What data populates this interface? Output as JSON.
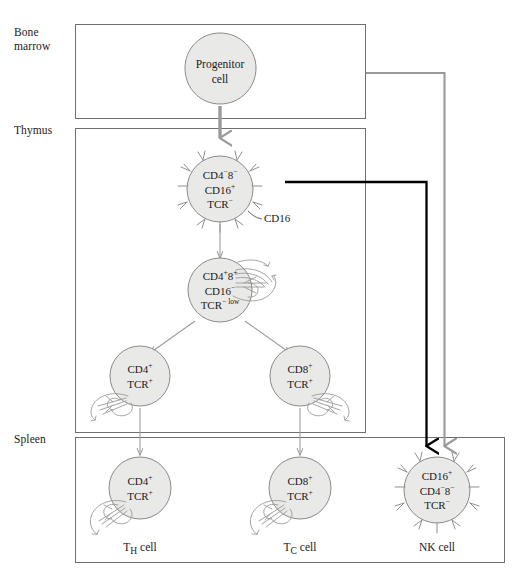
{
  "figure": {
    "background_color": "#ffffff",
    "cell_fill_color": "#e9e9e7",
    "cell_stroke_color": "#8a8a8a",
    "box_stroke_color": "#6f6f6f",
    "gray_arrow_color": "#9a9a9a",
    "black_arrow_color": "#000000"
  },
  "compartments": [
    {
      "id": "bone-marrow",
      "label": "Bone\nmarrow"
    },
    {
      "id": "thymus",
      "label": "Thymus"
    },
    {
      "id": "spleen",
      "label": "Spleen"
    }
  ],
  "cells": {
    "progenitor": {
      "name": "Progenitor cell",
      "label": "Progenitor\ncell"
    },
    "thymus_dn": {
      "name": "double negative thymocyte",
      "markers": [
        {
          "gene": "CD4",
          "sign": "−",
          "gene2": "8",
          "sign2": "−"
        },
        {
          "gene": "CD16",
          "sign": "+"
        },
        {
          "gene": "TCR",
          "sign": "−"
        }
      ],
      "line1": "CD4",
      "line1_sup1": "−",
      "line1_mid": "8",
      "line1_sup2": "−",
      "line2": "CD16",
      "line2_sup": "+",
      "line3": "TCR",
      "line3_sup": "−",
      "annotation": "CD16"
    },
    "thymus_dp": {
      "name": "double positive thymocyte",
      "line1": "CD4",
      "line1_sup1": "+",
      "line1_mid": "8",
      "line1_sup2": "+",
      "line2": "CD16",
      "line2_sup": "−",
      "line3": "TCR",
      "line3_sup": "− low"
    },
    "thymus_cd4": {
      "name": "CD4 single positive thymocyte",
      "line1": "CD4",
      "line1_sup": "+",
      "line2": "TCR",
      "line2_sup": "+"
    },
    "thymus_cd8": {
      "name": "CD8 single positive thymocyte",
      "line1": "CD8",
      "line1_sup": "+",
      "line2": "TCR",
      "line2_sup": "+"
    },
    "spleen_th": {
      "name": "helper T cell",
      "line1": "CD4",
      "line1_sup": "+",
      "line2": "TCR",
      "line2_sup": "+",
      "caption": "T",
      "caption_sub": "H",
      "caption_tail": " cell"
    },
    "spleen_tc": {
      "name": "cytotoxic T cell",
      "line1": "CD8",
      "line1_sup": "+",
      "line2": "TCR",
      "line2_sup": "+",
      "caption": "T",
      "caption_sub": "C",
      "caption_tail": " cell"
    },
    "spleen_nk": {
      "name": "natural killer cell",
      "line1": "CD16",
      "line1_sup": "+",
      "line2": "CD4",
      "line2_sup1": "−",
      "line2_mid": "8",
      "line2_sup2": "−",
      "line3": "TCR",
      "line3_sup": "−",
      "caption": "NK cell"
    }
  },
  "arrows": [
    {
      "id": "progenitor-to-thymus",
      "style": "thick-gray",
      "from": "progenitor",
      "to": "thymus_dn"
    },
    {
      "id": "dn-to-dp",
      "style": "thin-gray",
      "from": "thymus_dn",
      "to": "thymus_dp"
    },
    {
      "id": "dp-to-cd4",
      "style": "thin-gray",
      "from": "thymus_dp",
      "to": "thymus_cd4"
    },
    {
      "id": "dp-to-cd8",
      "style": "thin-gray",
      "from": "thymus_dp",
      "to": "thymus_cd8"
    },
    {
      "id": "cd4-to-th",
      "style": "thin-gray",
      "from": "thymus_cd4",
      "to": "spleen_th"
    },
    {
      "id": "cd8-to-tc",
      "style": "thin-gray",
      "from": "thymus_cd8",
      "to": "spleen_tc"
    },
    {
      "id": "marrow-to-nk",
      "style": "gray-elbow",
      "from": "bone-marrow",
      "to": "spleen_nk"
    },
    {
      "id": "dn-to-nk",
      "style": "black-elbow",
      "from": "thymus_dn",
      "to": "spleen_nk"
    }
  ]
}
